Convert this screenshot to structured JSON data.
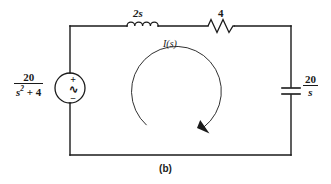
{
  "figure": {
    "caption": "(b)",
    "type": "series RLC circuit in the s-domain (Laplace transform)",
    "background_color": "#ffffff",
    "line_color": "#1a1a1a"
  },
  "source": {
    "name": "ac-voltage-source",
    "symbol": "circle-with-sine",
    "numerator": "20",
    "denominator_base": "s",
    "denominator_exponent": "2",
    "denominator_rest": "+ 4",
    "denominator_text": "s² + 4",
    "label_text": "20/(s² + 4)",
    "polarity_plus": "+",
    "polarity_minus": "−",
    "waveform_glyph": "∿"
  },
  "inductor": {
    "name": "inductor",
    "symbol": "coil",
    "label": "2s",
    "coils": 4
  },
  "resistor": {
    "name": "resistor",
    "symbol": "zigzag",
    "label": "4",
    "zigzags": 4
  },
  "capacitor": {
    "name": "capacitor",
    "symbol": "parallel-plates",
    "numerator": "20",
    "denominator": "s",
    "label_text": "20/s"
  },
  "loop_current": {
    "name": "mesh-current-arrow",
    "label": "I(s)",
    "label_italic_i": "I",
    "label_paren_open": "(",
    "label_italic_s": "s",
    "label_paren_close": ")",
    "direction": "clockwise"
  },
  "geometry": {
    "left_x": 70,
    "right_x": 291,
    "top_y": 26,
    "bottom_y": 155,
    "source_center": "73,88",
    "loop_center": "178,92",
    "loop_radius": 45
  }
}
